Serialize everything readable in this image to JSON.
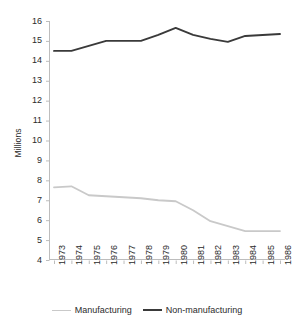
{
  "chart_data": {
    "type": "line",
    "title": "",
    "xlabel": "",
    "ylabel": "Millions",
    "categories": [
      "1973",
      "1974",
      "1975",
      "1976",
      "1977",
      "1978",
      "1979",
      "1980",
      "1981",
      "1982",
      "1983",
      "1984",
      "1985",
      "1986"
    ],
    "ylim": [
      4,
      16
    ],
    "y_ticks": [
      16,
      15,
      14,
      13,
      12,
      11,
      10,
      9,
      8,
      7,
      6,
      5,
      4
    ],
    "grid": false,
    "legend_position": "bottom",
    "series": [
      {
        "name": "Manufacturing",
        "color": "#c9c9c9",
        "values": [
          7.65,
          7.7,
          7.25,
          7.2,
          7.15,
          7.1,
          7.0,
          6.95,
          6.5,
          5.95,
          5.7,
          5.45,
          5.45,
          5.45
        ]
      },
      {
        "name": "Non-manufacturing",
        "color": "#3a3a3a",
        "values": [
          14.5,
          14.5,
          14.75,
          15.0,
          15.0,
          15.0,
          15.3,
          15.65,
          15.3,
          15.1,
          14.95,
          15.25,
          15.3,
          15.35
        ]
      }
    ]
  },
  "axes": {
    "y_title": "Millions",
    "axis_color": "#bdbdbd",
    "tick_color": "#bdbdbd"
  },
  "legend": {
    "items": [
      {
        "label": "Manufacturing",
        "swatch": "line-swatch-gray"
      },
      {
        "label": "Non-manufacturing",
        "swatch": "line-swatch-dark"
      }
    ]
  }
}
